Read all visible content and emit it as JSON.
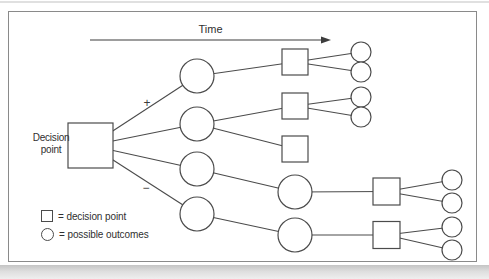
{
  "figure": {
    "time_label": "Time",
    "decision_label": {
      "line1": "Decision",
      "line2": "point"
    },
    "branch_signs": {
      "plus": "+",
      "minus": "−"
    },
    "legend": {
      "items": [
        {
          "symbol": "square",
          "label": "= decision point"
        },
        {
          "symbol": "circle",
          "label": "= possible outcomes"
        }
      ]
    },
    "colors": {
      "line": "#4b4b4b",
      "frame": "#8a8a8a",
      "text": "#2f2f2f",
      "node_fill": "#ffffff"
    },
    "graph": {
      "arrow": {
        "x1": 90,
        "y1": 40,
        "x2": 331,
        "y2": 40
      },
      "nodes": [
        {
          "id": "D",
          "name": "decision-point-node",
          "type": "square",
          "x": 90.5,
          "y": 145.5,
          "size": 45
        },
        {
          "id": "L1",
          "name": "outcome-node-plus-1",
          "type": "circle",
          "x": 197,
          "y": 76,
          "r": 17
        },
        {
          "id": "L2",
          "name": "outcome-node-plus-2",
          "type": "circle",
          "x": 197,
          "y": 124,
          "r": 17
        },
        {
          "id": "L3",
          "name": "outcome-node-minus-1",
          "type": "circle",
          "x": 197,
          "y": 169,
          "r": 17
        },
        {
          "id": "L4",
          "name": "outcome-node-minus-2",
          "type": "circle",
          "x": 197,
          "y": 214,
          "r": 17
        },
        {
          "id": "S1",
          "name": "decision-node-2-1",
          "type": "square",
          "x": 295,
          "y": 62,
          "size": 26
        },
        {
          "id": "S2",
          "name": "decision-node-2-2",
          "type": "square",
          "x": 295,
          "y": 106,
          "size": 26
        },
        {
          "id": "S3",
          "name": "decision-node-2-3",
          "type": "square",
          "x": 295,
          "y": 149,
          "size": 26
        },
        {
          "id": "M1",
          "name": "outcome-node-2-1",
          "type": "circle",
          "x": 295,
          "y": 192,
          "r": 17
        },
        {
          "id": "M2",
          "name": "outcome-node-2-2",
          "type": "circle",
          "x": 295,
          "y": 235,
          "r": 17
        },
        {
          "id": "R1",
          "name": "decision-node-3-1",
          "type": "square",
          "x": 386.5,
          "y": 191.5,
          "size": 27
        },
        {
          "id": "R2",
          "name": "decision-node-3-2",
          "type": "square",
          "x": 386.5,
          "y": 235,
          "size": 27
        },
        {
          "id": "O1",
          "name": "final-outcome-node-1",
          "type": "circle",
          "x": 361,
          "y": 52,
          "r": 10
        },
        {
          "id": "O2",
          "name": "final-outcome-node-2",
          "type": "circle",
          "x": 361,
          "y": 72,
          "r": 10
        },
        {
          "id": "O3",
          "name": "final-outcome-node-3",
          "type": "circle",
          "x": 361,
          "y": 97,
          "r": 10
        },
        {
          "id": "O4",
          "name": "final-outcome-node-4",
          "type": "circle",
          "x": 361,
          "y": 117,
          "r": 10
        },
        {
          "id": "O5",
          "name": "final-outcome-node-5",
          "type": "circle",
          "x": 452,
          "y": 180,
          "r": 10
        },
        {
          "id": "O6",
          "name": "final-outcome-node-6",
          "type": "circle",
          "x": 452,
          "y": 203,
          "r": 10
        },
        {
          "id": "O7",
          "name": "final-outcome-node-7",
          "type": "circle",
          "x": 452,
          "y": 227,
          "r": 10
        },
        {
          "id": "O8",
          "name": "final-outcome-node-8",
          "type": "circle",
          "x": 452,
          "y": 250,
          "r": 10
        }
      ],
      "edges": [
        {
          "from": "D",
          "to": "L1"
        },
        {
          "from": "D",
          "to": "L2"
        },
        {
          "from": "D",
          "to": "L3"
        },
        {
          "from": "D",
          "to": "L4"
        },
        {
          "from": "L1",
          "to": "S1"
        },
        {
          "from": "L2",
          "to": "S2"
        },
        {
          "from": "L2",
          "to": "S3"
        },
        {
          "from": "L3",
          "to": "M1"
        },
        {
          "from": "L4",
          "to": "M2"
        },
        {
          "from": "S1",
          "to": "O1"
        },
        {
          "from": "S1",
          "to": "O2"
        },
        {
          "from": "S2",
          "to": "O3"
        },
        {
          "from": "S2",
          "to": "O4"
        },
        {
          "from": "M1",
          "to": "R1"
        },
        {
          "from": "M2",
          "to": "R2"
        },
        {
          "from": "R1",
          "to": "O5"
        },
        {
          "from": "R1",
          "to": "O6"
        },
        {
          "from": "R2",
          "to": "O7"
        },
        {
          "from": "R2",
          "to": "O8"
        }
      ]
    }
  }
}
